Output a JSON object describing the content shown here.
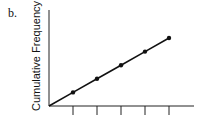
{
  "panel_label": "b.",
  "chart_data": {
    "type": "line",
    "title": "",
    "xlabel": "",
    "ylabel": "Cumulative Frequency",
    "x": [
      0,
      1,
      2,
      3,
      4,
      5
    ],
    "values": [
      0,
      1,
      2,
      3,
      4,
      5
    ],
    "x_ticks": 5,
    "x_tick_labels": [],
    "y_tick_labels": [],
    "grid": false,
    "legend": null,
    "markers": "filled circles at x=1..5",
    "xlim": [
      0,
      6
    ],
    "ylim": [
      0,
      6.3
    ]
  }
}
